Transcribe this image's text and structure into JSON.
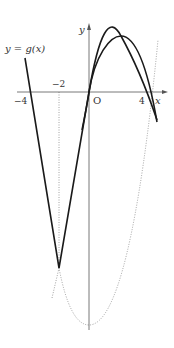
{
  "figure": {
    "curve_label": "y = g(x)",
    "axis_x_label": "x",
    "axis_y_label": "y",
    "origin_label": "O",
    "tick_labels": {
      "neg4": "−4",
      "neg2": "−2",
      "pos4": "4"
    },
    "colors": {
      "solid": "#1a1a1a",
      "dotted": "#8a8a8a",
      "axis": "#555555"
    }
  },
  "curves": [
    {
      "name": "g(x)",
      "style": "solid",
      "description": "graph of y=g(x): crosses x-axis at -4, 0 and 4, maximum near x=2, cusp at x=-2"
    },
    {
      "name": "auxiliary parabola",
      "style": "dotted",
      "description": "upward parabola with vertex on y-axis, passing through the cusp at x=-2"
    },
    {
      "name": "vertical guide",
      "style": "dotted",
      "description": "vertical line x=-2 from axis to cusp"
    }
  ]
}
